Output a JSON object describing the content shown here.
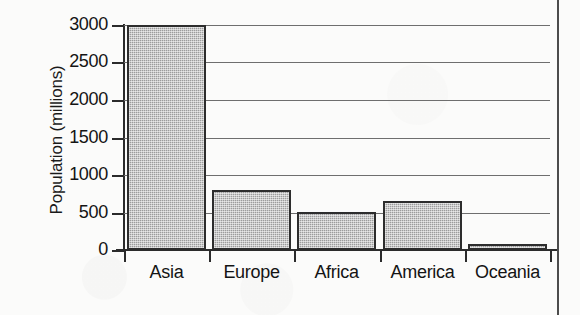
{
  "chart_data": {
    "type": "bar",
    "title": "",
    "xlabel": "",
    "ylabel": "Population (millions)",
    "categories": [
      "Asia",
      "Europe",
      "Africa",
      "America",
      "Oceania"
    ],
    "values": [
      3000,
      800,
      500,
      650,
      80
    ],
    "ylim": [
      0,
      3000
    ],
    "yticks": [
      0,
      500,
      1000,
      1500,
      2000,
      2500,
      3000
    ],
    "ytick_labels": [
      "0",
      "500",
      "1000",
      "1500",
      "2000",
      "2500",
      "3000"
    ],
    "grid": true,
    "grid_axis": "y",
    "legend": false,
    "legend_position": "none",
    "bar_fill_color": "#9c9c9c",
    "bar_edge_color": "#2d2d2d",
    "axis_color": "#2b2b2b",
    "gridline_color": "#6e6e6e",
    "background_color": "#fbfbfa"
  },
  "figure": {
    "border_right_color": "#4c4c4c"
  }
}
